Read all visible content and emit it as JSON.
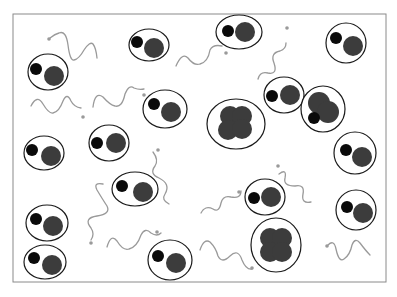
{
  "diagram": {
    "frame": {
      "x": 13,
      "y": 14,
      "w": 373,
      "h": 268,
      "stroke": "#8a8a8a"
    },
    "colors": {
      "shell": "#1a1a1a",
      "electron": "#0a0a0a",
      "nucleus": "#3c3c3c",
      "photon": "#9a9a9a"
    },
    "atoms": [
      {
        "type": "hydrogen",
        "cx": 48,
        "cy": 72,
        "rx": 20,
        "ry": 18,
        "e": [
          36,
          69,
          6
        ],
        "n": [
          54,
          76,
          10
        ]
      },
      {
        "type": "hydrogen",
        "cx": 149,
        "cy": 45,
        "rx": 20,
        "ry": 16,
        "e": [
          137,
          42,
          6
        ],
        "n": [
          154,
          48,
          10
        ]
      },
      {
        "type": "hydrogen",
        "cx": 239,
        "cy": 32,
        "rx": 23,
        "ry": 17,
        "e": [
          228,
          31,
          6
        ],
        "n": [
          245,
          32,
          10
        ]
      },
      {
        "type": "hydrogen",
        "cx": 346,
        "cy": 43,
        "rx": 20,
        "ry": 20,
        "e": [
          336,
          38,
          6
        ],
        "n": [
          353,
          46,
          10
        ]
      },
      {
        "type": "hydrogen",
        "cx": 165,
        "cy": 109,
        "rx": 22,
        "ry": 19,
        "e": [
          154,
          104,
          6
        ],
        "n": [
          171,
          112,
          10
        ]
      },
      {
        "type": "hydrogen",
        "cx": 109,
        "cy": 143,
        "rx": 20,
        "ry": 18,
        "e": [
          97,
          143,
          6
        ],
        "n": [
          116,
          143,
          10
        ]
      },
      {
        "type": "hydrogen",
        "cx": 44,
        "cy": 153,
        "rx": 20,
        "ry": 17,
        "e": [
          32,
          150,
          6
        ],
        "n": [
          51,
          156,
          10
        ]
      },
      {
        "type": "hydrogen",
        "cx": 284,
        "cy": 95,
        "rx": 20,
        "ry": 18,
        "e": [
          272,
          96,
          6
        ],
        "n": [
          290,
          95,
          10
        ]
      },
      {
        "type": "hydrogen",
        "cx": 355,
        "cy": 153,
        "rx": 21,
        "ry": 21,
        "e": [
          346,
          150,
          6
        ],
        "n": [
          362,
          157,
          10
        ]
      },
      {
        "type": "hydrogen",
        "cx": 135,
        "cy": 189,
        "rx": 23,
        "ry": 17,
        "e": [
          122,
          186,
          6
        ],
        "n": [
          143,
          192,
          10
        ]
      },
      {
        "type": "hydrogen",
        "cx": 265,
        "cy": 197,
        "rx": 20,
        "ry": 18,
        "e": [
          254,
          198,
          6
        ],
        "n": [
          271,
          197,
          10
        ]
      },
      {
        "type": "hydrogen",
        "cx": 356,
        "cy": 210,
        "rx": 20,
        "ry": 20,
        "e": [
          347,
          207,
          6
        ],
        "n": [
          363,
          213,
          10
        ]
      },
      {
        "type": "hydrogen",
        "cx": 47,
        "cy": 223,
        "rx": 21,
        "ry": 18,
        "e": [
          36,
          219,
          6
        ],
        "n": [
          53,
          226,
          10
        ]
      },
      {
        "type": "hydrogen",
        "cx": 45,
        "cy": 262,
        "rx": 21,
        "ry": 17,
        "e": [
          34,
          258,
          6
        ],
        "n": [
          52,
          265,
          10
        ]
      },
      {
        "type": "hydrogen",
        "cx": 170,
        "cy": 260,
        "rx": 22,
        "ry": 20,
        "e": [
          158,
          256,
          6
        ],
        "n": [
          176,
          263,
          10
        ]
      },
      {
        "type": "deuterium",
        "cx": 323,
        "cy": 109,
        "rx": 22,
        "ry": 23
      },
      {
        "type": "helium",
        "cx": 236,
        "cy": 124,
        "rx": 29,
        "ry": 25
      },
      {
        "type": "helium4",
        "cx": 276,
        "cy": 245,
        "rx": 25,
        "ry": 27
      }
    ],
    "photons": [
      {
        "d": "M 50 38 q 5 -4 9 -5 q 7 -3 9 12 q 2 16 6 15 q 5 -1 10 -10 q 6 -9 9 -6 q 3 4 4 14",
        "arrow": [
          49,
          39
        ]
      },
      {
        "d": "M 31 106 q 6 -12 12 -2 q 6 10 10 9 q 6 -1 10 -12 q 4 -9 8 0 q 3 6 10 7",
        "arrow": [
          83,
          117
        ]
      },
      {
        "d": "M 93 107 q 2 -16 10 -10 q 7 8 12 9 q 7 2 10 -12 q 4 -10 9 -6 q 5 2 10 1",
        "arrow": [
          144,
          95
        ]
      },
      {
        "d": "M 176 66 q 6 -14 12 -8 q 6 8 12 6 q 8 -2 10 -14 q 3 -6 12 -4",
        "arrow": [
          226,
          53
        ]
      },
      {
        "d": "M 258 79 q 2 -8 10 -6 q 10 2 6 -10 q -4 -10 6 -12 q 6 -2 6 -8",
        "arrow": [
          287,
          28
        ]
      },
      {
        "d": "M 153 152 q 6 8 2 14 q -6 8 4 12 q 12 6 6 16 q -4 6 4 10",
        "arrow": [
          158,
          150
        ]
      },
      {
        "d": "M 103 184 q -10 -2 -6 6 q 6 10 10 16 q 4 8 -10 10 q -14 2 -6 12 q 4 6 0 12",
        "arrow": [
          91,
          243
        ]
      },
      {
        "d": "M 107 247 q 4 -14 10 -6 q 6 10 12 8 q 8 -2 12 -14 q 4 -8 10 -2 q 6 4 10 0",
        "arrow": [
          157,
          232
        ]
      },
      {
        "d": "M 201 213 q 4 -8 12 -4 q 6 4 8 -6 q 2 -8 10 -6 q 10 2 10 -6",
        "arrow": [
          239,
          192
        ]
      },
      {
        "d": "M 279 174 q 8 -6 6 4 q -2 8 10 8 q 10 -2 8 8 q -2 10 8 8",
        "arrow": [
          278,
          166
        ]
      },
      {
        "d": "M 200 250 q 4 -12 10 -8 q 6 6 8 14 q 4 8 12 0 q 8 -8 12 4 q 4 10 10 9",
        "arrow": [
          252,
          268
        ]
      },
      {
        "d": "M 328 245 q 6 -6 8 4 q 3 14 8 10 q 6 -4 8 -14 q 3 -8 8 -2 q 6 8 10 12",
        "arrow": [
          327,
          246
        ]
      }
    ]
  }
}
